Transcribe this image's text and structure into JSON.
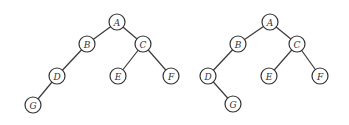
{
  "diagram": {
    "type": "binary-trees",
    "node_radius": 8,
    "trees": [
      {
        "id": "left-tree",
        "nodes": [
          {
            "id": "A",
            "label": "A",
            "x": 117,
            "y": 22
          },
          {
            "id": "B",
            "label": "B",
            "x": 87,
            "y": 44
          },
          {
            "id": "C",
            "label": "C",
            "x": 143,
            "y": 44
          },
          {
            "id": "D",
            "label": "D",
            "x": 57,
            "y": 76
          },
          {
            "id": "E",
            "label": "E",
            "x": 118,
            "y": 76
          },
          {
            "id": "F",
            "label": "F",
            "x": 171,
            "y": 76
          },
          {
            "id": "G",
            "label": "G",
            "x": 33,
            "y": 105
          }
        ],
        "edges": [
          [
            "A",
            "B"
          ],
          [
            "A",
            "C"
          ],
          [
            "B",
            "D"
          ],
          [
            "C",
            "E"
          ],
          [
            "C",
            "F"
          ],
          [
            "D",
            "G"
          ]
        ]
      },
      {
        "id": "right-tree",
        "nodes": [
          {
            "id": "A",
            "label": "A",
            "x": 270,
            "y": 22
          },
          {
            "id": "B",
            "label": "B",
            "x": 238,
            "y": 44
          },
          {
            "id": "C",
            "label": "C",
            "x": 297,
            "y": 44
          },
          {
            "id": "D",
            "label": "D",
            "x": 208,
            "y": 76
          },
          {
            "id": "E",
            "label": "E",
            "x": 269,
            "y": 76
          },
          {
            "id": "F",
            "label": "F",
            "x": 320,
            "y": 76
          },
          {
            "id": "G",
            "label": "G",
            "x": 233,
            "y": 104
          }
        ],
        "edges": [
          [
            "A",
            "B"
          ],
          [
            "A",
            "C"
          ],
          [
            "B",
            "D"
          ],
          [
            "C",
            "E"
          ],
          [
            "C",
            "F"
          ],
          [
            "D",
            "G"
          ]
        ]
      }
    ]
  }
}
